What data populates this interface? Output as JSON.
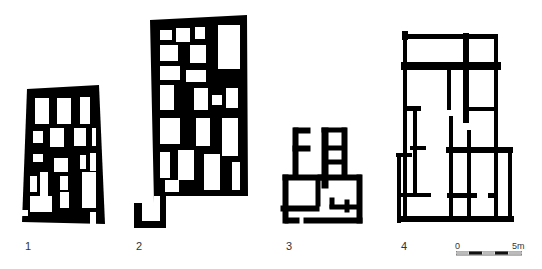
{
  "figure": {
    "plans": [
      {
        "id": "1",
        "label": "1"
      },
      {
        "id": "2",
        "label": "2"
      },
      {
        "id": "3",
        "label": "3"
      },
      {
        "id": "4",
        "label": "4"
      }
    ],
    "scale_bar": {
      "start_label": "0",
      "end_label": "5m",
      "segments": 5
    },
    "colors": {
      "wall": "#000000",
      "background": "#ffffff",
      "label": "#333333"
    }
  }
}
